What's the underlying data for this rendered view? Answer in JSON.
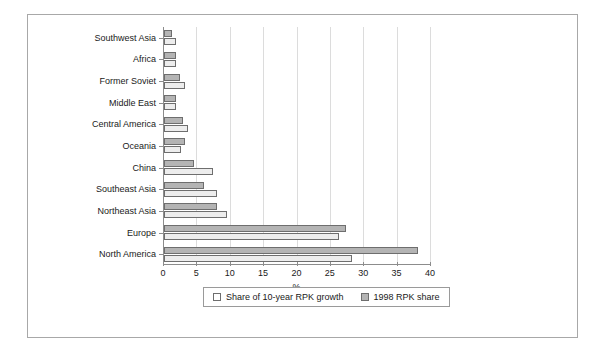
{
  "chart_data": {
    "type": "bar",
    "orientation": "horizontal",
    "title": "",
    "xlabel": "%",
    "ylabel": "",
    "xlim": [
      0,
      40
    ],
    "xticks": [
      0,
      5,
      10,
      15,
      20,
      25,
      30,
      35,
      40
    ],
    "grid": "vertical",
    "legend_position": "bottom-center",
    "categories": [
      "Southwest Asia",
      "Africa",
      "Former Soviet",
      "Middle East",
      "Central America",
      "Oceania",
      "China",
      "Southeast Asia",
      "Northeast Asia",
      "Europe",
      "North America"
    ],
    "series": [
      {
        "name": "Share of 10-year RPK growth",
        "color": "#ededed",
        "values": [
          1.8,
          1.8,
          3.1,
          1.8,
          3.6,
          2.5,
          7.4,
          7.9,
          9.5,
          26.2,
          28.2
        ]
      },
      {
        "name": "1998 RPK share",
        "color": "#b4b4b4",
        "values": [
          1.2,
          1.8,
          2.4,
          1.8,
          2.9,
          3.2,
          4.5,
          6.0,
          8.0,
          27.3,
          38.0
        ]
      }
    ]
  },
  "legend": {
    "items": [
      {
        "label": "Share of 10-year RPK growth",
        "swatch": "light"
      },
      {
        "label": "1998 RPK share",
        "swatch": "dark"
      }
    ]
  },
  "colors": {
    "series_light": "#ededed",
    "series_dark": "#b4b4b4",
    "bar_edge": "#6e6e6e",
    "axis": "#8c8c8c",
    "gridline": "#dcdcdc",
    "frame": "#a8a8a8",
    "text": "#1a1a1a"
  }
}
